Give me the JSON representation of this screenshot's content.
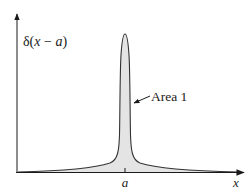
{
  "figure": {
    "type": "dirac-delta-approximation",
    "y_axis_label": "δ(x − a)",
    "y_label_parts": {
      "delta": "δ(",
      "x": "x",
      "minus": " − ",
      "a": "a",
      "close": ")"
    },
    "x_axis_label": "x",
    "x_tick_label": "a",
    "annotation": "Area 1",
    "colors": {
      "axis": "#1a1a1a",
      "curve": "#333333",
      "fill": "#e4e4e4",
      "text": "#1a1a1a"
    }
  }
}
